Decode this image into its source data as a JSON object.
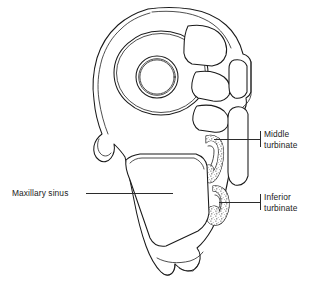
{
  "figure": {
    "kind": "anatomical-illustration",
    "background_color": "#ffffff",
    "ink_color": "#1a1a1a",
    "label_color": "#1b1b1b"
  },
  "labels": [
    {
      "id": "middle-turbinate",
      "line1": "Middle",
      "line2": "turbinate",
      "align": "left",
      "x": 264,
      "y": 134
    },
    {
      "id": "inferior-turbinate",
      "line1": "Inferior",
      "line2": "turbinate",
      "align": "left",
      "x": 264,
      "y": 196
    },
    {
      "id": "maxillary-sinus",
      "line1": "Maxillary sinus",
      "line2": "",
      "align": "right",
      "x": 12,
      "y": 196
    }
  ],
  "structures": [
    {
      "id": "orbit",
      "name": "orbital cavity"
    },
    {
      "id": "optic-ring",
      "name": "optic nerve ring"
    },
    {
      "id": "ethmoid-cells",
      "name": "ethmoid air cells"
    },
    {
      "id": "nasal-septum",
      "name": "nasal septum"
    },
    {
      "id": "middle-turbinate-scroll",
      "name": "middle turbinate"
    },
    {
      "id": "inferior-turbinate-scroll",
      "name": "inferior turbinate"
    },
    {
      "id": "maxillary-sinus-cavity",
      "name": "maxillary sinus"
    },
    {
      "id": "alveolar-process",
      "name": "alveolar process"
    }
  ]
}
